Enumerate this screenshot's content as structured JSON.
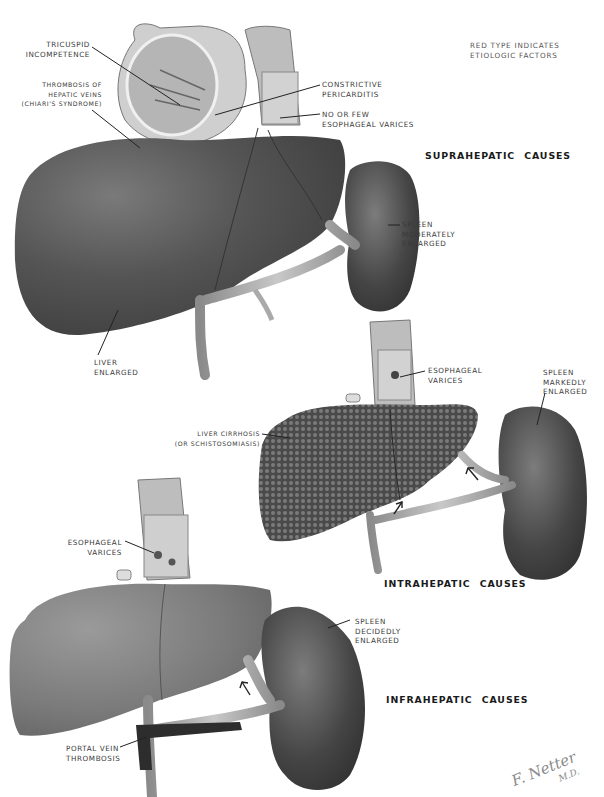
{
  "legend": {
    "line1": "RED TYPE INDICATES",
    "line2": "ETIOLOGIC FACTORS"
  },
  "sections": [
    {
      "heading": "SUPRAHEPATIC CAUSES",
      "labels": {
        "tricuspid": [
          "TRICUSPID",
          "INCOMPETENCE"
        ],
        "thrombosis": [
          "THROMBOSIS OF",
          "HEPATIC VEINS",
          "(CHIARI'S SYNDROME)"
        ],
        "pericarditis": [
          "CONSTRICTIVE",
          "PERICARDITIS"
        ],
        "varices": [
          "NO OR FEW",
          "ESOPHAGEAL VARICES"
        ],
        "spleen": [
          "SPLEEN",
          "MODERATELY",
          "ENLARGED"
        ],
        "liver": [
          "LIVER",
          "ENLARGED"
        ]
      }
    },
    {
      "heading": "INTRAHEPATIC CAUSES",
      "labels": {
        "varices": [
          "ESOPHAGEAL",
          "VARICES"
        ],
        "spleen": [
          "SPLEEN",
          "MARKEDLY",
          "ENLARGED"
        ],
        "liver": [
          "LIVER CIRRHOSIS",
          "(OR SCHISTOSOMIASIS)"
        ]
      }
    },
    {
      "heading": "INFRAHEPATIC CAUSES",
      "labels": {
        "varices": [
          "ESOPHAGEAL",
          "VARICES"
        ],
        "spleen": [
          "SPLEEN",
          "DECIDEDLY",
          "ENLARGED"
        ],
        "portal": [
          "PORTAL VEIN",
          "THROMBOSIS"
        ]
      }
    }
  ],
  "signature": {
    "name": "F. Netter",
    "degree": "M.D."
  },
  "colors": {
    "liver_dark": "#4a4a4a",
    "liver_mid": "#6e6e6e",
    "spleen": "#3c3c3c",
    "vessel": "#9a9a9a",
    "label_text": "#3a3a3a",
    "heading_text": "#1a1a1a"
  }
}
